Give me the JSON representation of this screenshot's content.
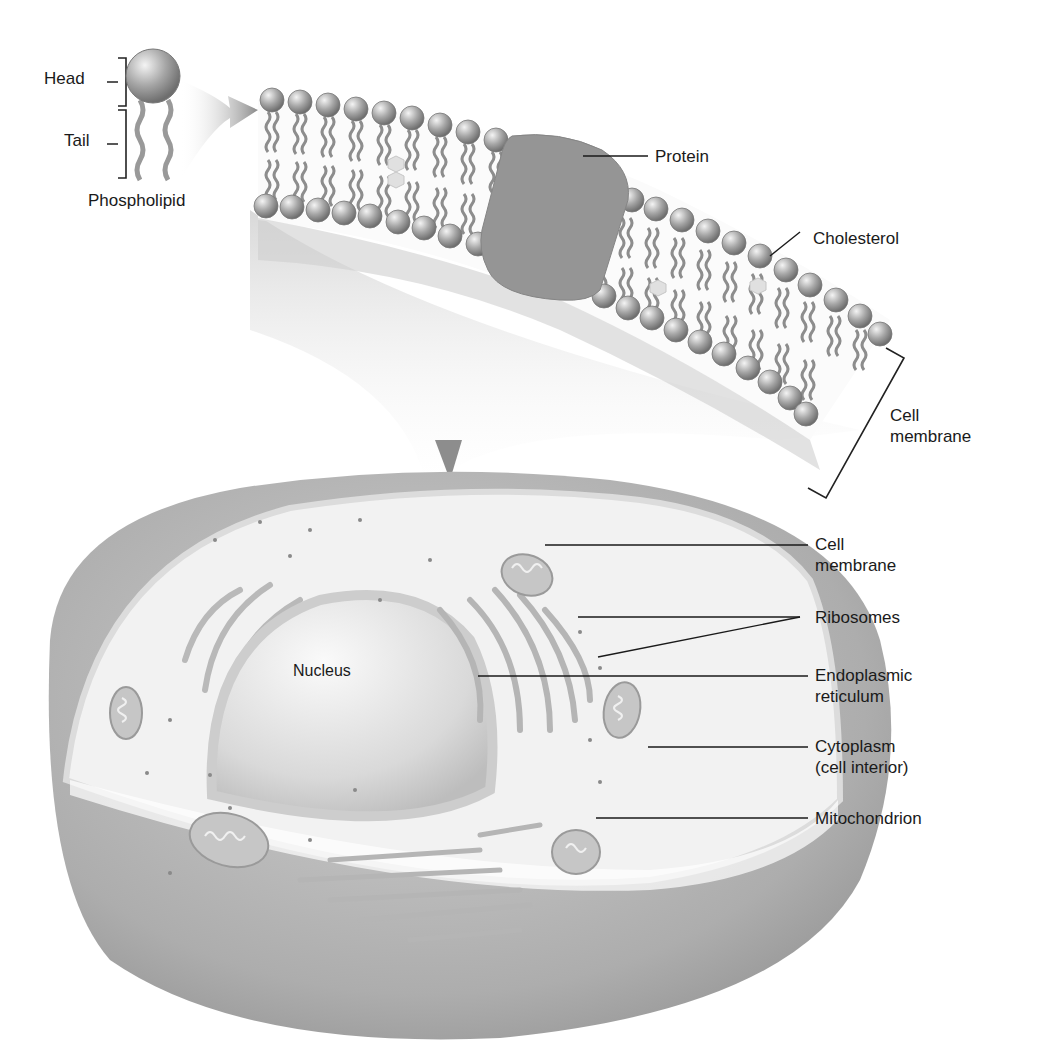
{
  "diagram": {
    "title": "",
    "colors": {
      "background": "#ffffff",
      "cell_outer": "#a8a8a8",
      "cytoplasm": "#f2f2f2",
      "nucleus": "#e2e2e2",
      "head": "#9c9c9c",
      "tail": "#8a8a8a",
      "protein": "#959595",
      "leader_line": "#1a1a1a"
    },
    "phospholipid_inset": {
      "head_label": "Head",
      "tail_label": "Tail",
      "caption": "Phospholipid"
    },
    "membrane_closeup": {
      "labels": {
        "protein": "Protein",
        "cholesterol": "Cholesterol",
        "cell_membrane_line1": "Cell",
        "cell_membrane_line2": "membrane"
      }
    },
    "cell": {
      "nucleus_label": "Nucleus",
      "labels": [
        {
          "id": "cell-membrane",
          "line1": "Cell",
          "line2": "membrane"
        },
        {
          "id": "ribosomes",
          "line1": "Ribosomes",
          "line2": ""
        },
        {
          "id": "endoplasmic-reticulum",
          "line1": "Endoplasmic",
          "line2": "reticulum"
        },
        {
          "id": "cytoplasm",
          "line1": "Cytoplasm",
          "line2": "(cell interior)"
        },
        {
          "id": "mitochondrion",
          "line1": "Mitochondrion",
          "line2": ""
        }
      ]
    }
  }
}
